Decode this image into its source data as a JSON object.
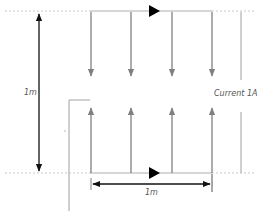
{
  "diagram": {
    "type": "current-sheet-diagram",
    "labels": {
      "height_dimension": "1m",
      "width_dimension": "1m",
      "current": "Current 1A"
    },
    "colors": {
      "background": "#ffffff",
      "rail": "#c8c8c8",
      "rail_dotted": "#c8c8c8",
      "current_arrows": "#808080",
      "dimension_arrows": "#111111",
      "direction_marker": "#000000",
      "label_text": "#555555"
    },
    "top_rail": {
      "direction": "right"
    },
    "bottom_rail": {
      "direction": "right"
    },
    "down_arrows_count": 4,
    "up_arrows_count": 4
  }
}
